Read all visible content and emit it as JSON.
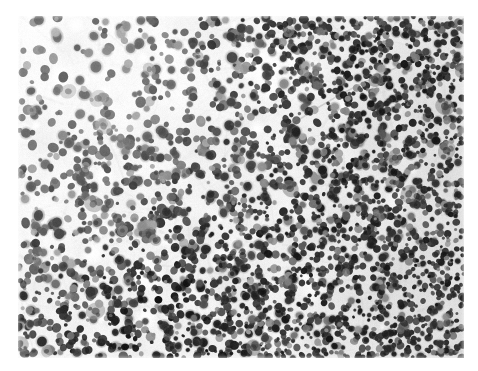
{
  "document": {
    "type": "histopathology-micrograph",
    "modality": "brightfield light microscopy",
    "stain": "hematoxylin and eosin",
    "rendering": "grayscale",
    "background_color": "#ffffff",
    "caption": ""
  },
  "figure": {
    "name": "tissue-micrograph",
    "frame": {
      "x": 18,
      "y": 16,
      "width": 446,
      "height": 342
    },
    "field": {
      "tissue_tone": "#f0efec",
      "nucleus_dark": "#1a1a1a",
      "nucleus_mid": "#4a4a4a",
      "nucleus_light": "#7d7d7d",
      "stroma_tone": "#cfcdc9",
      "lacuna_tone": "#fdfdfd"
    },
    "regions": [
      {
        "name": "upper-left-pale-zone",
        "description": "pale, sparsely cellular area with scattered larger nuclei",
        "cell_density": "low",
        "mean_tone": "#f4f3f1"
      },
      {
        "name": "central-transition-zone",
        "description": "intermediate cellularity with interspersed pale stroma",
        "cell_density": "medium",
        "mean_tone": "#eceae7"
      },
      {
        "name": "right-hypercellular-zone",
        "description": "densely packed small dark nuclei forming confluent sheets",
        "cell_density": "high",
        "mean_tone": "#b9b7b4"
      },
      {
        "name": "lower-band",
        "description": "moderately dense small round nuclei across the inferior field",
        "cell_density": "medium-high",
        "mean_tone": "#dedcd9"
      }
    ],
    "features": [
      {
        "name": "vascular-septum",
        "description": "pale elongated band running obliquely through the upper right field",
        "x": 330,
        "y": 78,
        "length": 120,
        "angle_deg": 28
      },
      {
        "name": "lacuna-upper-center",
        "description": "clear unstained space",
        "x": 245,
        "y": 52,
        "radius": 12
      },
      {
        "name": "lacuna-mid-left",
        "description": "clear unstained space",
        "x": 128,
        "y": 258,
        "radius": 10
      },
      {
        "name": "lacuna-lower-center",
        "description": "clear unstained space",
        "x": 296,
        "y": 272,
        "radius": 9
      }
    ],
    "nuclei": {
      "approximate_count": 3200,
      "mean_diameter_px": 5.6,
      "min_diameter_px": 3.2,
      "max_diameter_px": 9.5,
      "shape": "round to ovoid"
    }
  }
}
